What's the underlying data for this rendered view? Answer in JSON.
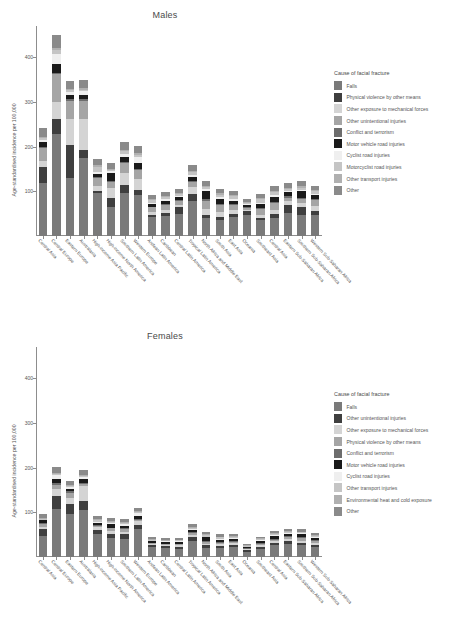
{
  "figure": {
    "ylabel": "Age-standardised incidence per 100,000",
    "legend_title": "Cause of facial fracture"
  },
  "chart_data": [
    {
      "type": "bar",
      "title": "Males",
      "xlabel": "",
      "ylabel": "Age-standardised incidence per 100,000",
      "ylim": [
        0,
        470
      ],
      "yticks": [
        100,
        200,
        300,
        400
      ],
      "grid": false,
      "legend_position": "right",
      "legend_title": "Cause of facial fracture",
      "stacked": true,
      "categories": [
        "Central Asia",
        "Central Europe",
        "Eastern Europe",
        "Australasia",
        "High-income Asia Pacific",
        "High-income North America",
        "Southern Latin America",
        "Western Europe",
        "Andean Latin America",
        "Caribbean",
        "Central Latin America",
        "Tropical Latin America",
        "North Africa and Middle East",
        "South Asia",
        "East Asia",
        "Oceania",
        "Southeast Asia",
        "Central Asia",
        "Eastern Sub-Saharan Africa",
        "Southern Sub-Saharan Africa",
        "Western Sub-Saharan Africa"
      ],
      "series": [
        {
          "name": "Falls",
          "color": "#7a7a7a",
          "values": [
            118,
            228,
            130,
            175,
            96,
            66,
            96,
            92,
            42,
            45,
            49,
            78,
            41,
            36,
            43,
            46,
            36,
            40,
            52,
            46,
            47
          ]
        },
        {
          "name": "Physical violence by other means",
          "color": "#3f3f3f",
          "values": [
            36,
            34,
            74,
            18,
            4,
            20,
            19,
            12,
            6,
            6,
            15,
            17,
            7,
            7,
            6,
            9,
            4,
            9,
            18,
            19,
            10
          ]
        },
        {
          "name": "Other exposure to mechanical forces",
          "color": "#d4d4d4",
          "values": [
            14,
            38,
            58,
            68,
            12,
            22,
            26,
            24,
            6,
            8,
            6,
            14,
            12,
            11,
            9,
            3,
            8,
            10,
            8,
            9,
            11
          ]
        },
        {
          "name": "Other unintentional injuries",
          "color": "#a5a5a5",
          "values": [
            28,
            62,
            40,
            42,
            18,
            14,
            22,
            20,
            10,
            11,
            8,
            12,
            18,
            15,
            12,
            5,
            13,
            14,
            8,
            9,
            12
          ]
        },
        {
          "name": "Conflict and terrorism",
          "color": "#6d6d6d",
          "values": [
            3,
            4,
            4,
            3,
            2,
            2,
            3,
            3,
            2,
            2,
            2,
            2,
            4,
            3,
            2,
            2,
            2,
            3,
            3,
            3,
            3
          ]
        },
        {
          "name": "Motor vehicle road injuries",
          "color": "#1a1a1a",
          "values": [
            12,
            20,
            10,
            10,
            6,
            16,
            11,
            13,
            6,
            7,
            7,
            9,
            19,
            11,
            7,
            4,
            9,
            12,
            9,
            15,
            8
          ]
        },
        {
          "name": "Cyclist road injuries",
          "color": "#efefef",
          "values": [
            4,
            22,
            6,
            8,
            5,
            5,
            7,
            13,
            3,
            3,
            3,
            4,
            4,
            4,
            4,
            2,
            3,
            4,
            3,
            3,
            4
          ]
        },
        {
          "name": "Motorcyclist road injuries",
          "color": "#c5c5c5",
          "values": [
            4,
            9,
            5,
            4,
            12,
            3,
            6,
            5,
            5,
            6,
            5,
            7,
            5,
            6,
            6,
            3,
            9,
            6,
            4,
            4,
            5
          ]
        },
        {
          "name": "Other transport injuries",
          "color": "#b0b0b0",
          "values": [
            3,
            4,
            3,
            3,
            3,
            3,
            3,
            3,
            2,
            2,
            2,
            3,
            3,
            3,
            3,
            2,
            2,
            3,
            3,
            3,
            3
          ]
        },
        {
          "name": "Other",
          "color": "#8a8a8a",
          "values": [
            20,
            28,
            18,
            18,
            14,
            12,
            17,
            17,
            9,
            9,
            9,
            12,
            10,
            9,
            9,
            6,
            9,
            11,
            10,
            12,
            10
          ]
        }
      ]
    },
    {
      "type": "bar",
      "title": "Females",
      "xlabel": "",
      "ylabel": "Age-standardised incidence per 100,000",
      "ylim": [
        0,
        470
      ],
      "yticks": [
        100,
        200,
        300,
        400
      ],
      "grid": false,
      "legend_position": "right",
      "legend_title": "Cause of facial fracture",
      "stacked": true,
      "categories": [
        "Central Asia",
        "Central Europe",
        "Eastern Europe",
        "Australasia",
        "High-income Asia Pacific",
        "High-income North America",
        "Southern Latin America",
        "Western Europe",
        "Andean Latin America",
        "Caribbean",
        "Central Latin America",
        "Tropical Latin America",
        "North Africa and Middle East",
        "South Asia",
        "East Asia",
        "Oceania",
        "Southeast Asia",
        "Central Asia",
        "Eastern Sub-Saharan Africa",
        "Southern Sub-Saharan Africa",
        "Western Sub-Saharan Africa"
      ],
      "series": [
        {
          "name": "Falls",
          "color": "#7a7a7a",
          "values": [
            48,
            108,
            96,
            106,
            52,
            42,
            40,
            62,
            22,
            20,
            19,
            36,
            20,
            20,
            22,
            12,
            18,
            26,
            30,
            26,
            22
          ]
        },
        {
          "name": "Other unintentional injuries",
          "color": "#3f3f3f",
          "values": [
            14,
            28,
            22,
            20,
            8,
            10,
            11,
            10,
            4,
            4,
            4,
            8,
            6,
            5,
            5,
            3,
            5,
            6,
            6,
            6,
            6
          ]
        },
        {
          "name": "Other exposure to mechanical forces",
          "color": "#d4d4d4",
          "values": [
            6,
            16,
            14,
            32,
            7,
            6,
            6,
            8,
            3,
            3,
            3,
            5,
            4,
            4,
            4,
            2,
            4,
            4,
            4,
            4,
            4
          ]
        },
        {
          "name": "Physical violence by other means",
          "color": "#a5a5a5",
          "values": [
            6,
            10,
            12,
            6,
            3,
            6,
            5,
            4,
            2,
            2,
            3,
            4,
            3,
            3,
            3,
            2,
            2,
            3,
            5,
            6,
            4
          ]
        },
        {
          "name": "Conflict and terrorism",
          "color": "#6d6d6d",
          "values": [
            2,
            3,
            3,
            2,
            2,
            2,
            2,
            2,
            1,
            1,
            1,
            2,
            3,
            2,
            2,
            1,
            2,
            2,
            2,
            2,
            2
          ]
        },
        {
          "name": "Motor vehicle road injuries",
          "color": "#1a1a1a",
          "values": [
            6,
            10,
            6,
            8,
            4,
            8,
            6,
            6,
            3,
            3,
            4,
            5,
            8,
            5,
            4,
            2,
            5,
            6,
            5,
            7,
            5
          ]
        },
        {
          "name": "Cyclist road injuries",
          "color": "#efefef",
          "values": [
            2,
            8,
            3,
            5,
            3,
            3,
            3,
            6,
            2,
            2,
            2,
            2,
            2,
            2,
            2,
            1,
            2,
            2,
            2,
            2,
            2
          ]
        },
        {
          "name": "Other transport injuries",
          "color": "#c5c5c5",
          "values": [
            2,
            4,
            3,
            3,
            4,
            2,
            3,
            3,
            2,
            2,
            2,
            3,
            3,
            3,
            3,
            2,
            3,
            3,
            2,
            2,
            3
          ]
        },
        {
          "name": "Environmental heat and cold exposure",
          "color": "#b0b0b0",
          "values": [
            2,
            2,
            2,
            2,
            2,
            2,
            2,
            2,
            1,
            1,
            1,
            2,
            2,
            2,
            2,
            1,
            1,
            2,
            2,
            2,
            2
          ]
        },
        {
          "name": "Other",
          "color": "#8a8a8a",
          "values": [
            8,
            12,
            10,
            10,
            6,
            6,
            7,
            7,
            4,
            4,
            4,
            6,
            5,
            5,
            5,
            3,
            4,
            5,
            5,
            5,
            5
          ]
        }
      ]
    }
  ],
  "caption": ""
}
